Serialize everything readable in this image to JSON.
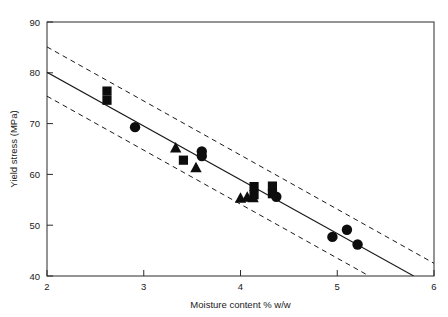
{
  "chart_data": {
    "type": "scatter",
    "title": "",
    "subtitle": "",
    "xlabel": "Moisture content % w/w",
    "ylabel": "Yield stress (MPa)",
    "xlim": [
      2,
      6
    ],
    "ylim": [
      40,
      90
    ],
    "xticks": [
      2,
      3,
      4,
      5,
      6
    ],
    "yticks": [
      40,
      50,
      60,
      70,
      80,
      90
    ],
    "xtick_labels": [
      "2",
      "3",
      "4",
      "5",
      "6"
    ],
    "ytick_labels": [
      "40",
      "50",
      "60",
      "70",
      "80",
      "90"
    ],
    "grid": false,
    "legend": "none",
    "marker_color": "#0d0d0d",
    "line_color": "#1a1a1a",
    "frame_color": "#2b2b2b",
    "series": [
      {
        "name": "circle",
        "marker": "circle",
        "points": [
          [
            2.91,
            69.3
          ],
          [
            3.6,
            64.5
          ],
          [
            3.6,
            63.6
          ],
          [
            4.37,
            55.6
          ],
          [
            4.95,
            47.7
          ],
          [
            5.1,
            49.1
          ],
          [
            5.21,
            46.2
          ]
        ]
      },
      {
        "name": "square",
        "marker": "square",
        "points": [
          [
            2.62,
            76.4
          ],
          [
            2.62,
            74.6
          ],
          [
            3.41,
            62.8
          ],
          [
            4.14,
            57.6
          ],
          [
            4.14,
            56.0
          ],
          [
            4.33,
            57.7
          ],
          [
            4.33,
            56.2
          ]
        ]
      },
      {
        "name": "triangle",
        "marker": "triangle",
        "points": [
          [
            3.33,
            65.1
          ],
          [
            3.54,
            61.2
          ],
          [
            4.0,
            55.2
          ],
          [
            4.07,
            55.4
          ],
          [
            4.13,
            55.3
          ]
        ]
      }
    ],
    "fit_line": {
      "name": "regression line",
      "style": "solid",
      "points": [
        [
          2.0,
          80.1
        ],
        [
          5.79,
          40.0
        ]
      ]
    },
    "confidence_bands": [
      {
        "name": "upper confidence limit",
        "style": "dashed",
        "points": [
          [
            2.0,
            85.1
          ],
          [
            6.0,
            42.5
          ]
        ]
      },
      {
        "name": "lower confidence limit",
        "style": "dashed",
        "points": [
          [
            2.0,
            75.4
          ],
          [
            5.33,
            40.0
          ]
        ]
      }
    ]
  }
}
